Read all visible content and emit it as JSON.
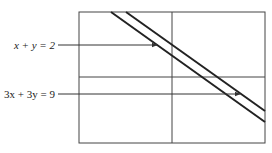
{
  "diagram": {
    "type": "graph-of-parallel-lines",
    "axes": {
      "x_axis_y": 77,
      "y_axis_x": 172
    },
    "frame": {
      "x": 79,
      "y": 12,
      "width": 186,
      "height": 131
    },
    "lines": [
      {
        "equation": "x + y = 2",
        "label": "x + y = 2",
        "x1": 111,
        "y1": 12,
        "x2": 265,
        "y2": 122
      },
      {
        "equation": "3x + 3y = 9",
        "label": "3x + 3y = 9",
        "x1": 126,
        "y1": 12,
        "x2": 265,
        "y2": 111
      }
    ],
    "annotations": [
      {
        "text": "x + y = 2",
        "label_x": 55,
        "label_y": 49,
        "arrow_from_x": 58,
        "arrow_to_x": 157,
        "arrow_y": 45
      },
      {
        "text": "3x + 3y = 9",
        "label_x": 55,
        "label_y": 98,
        "arrow_from_x": 58,
        "arrow_to_x": 240,
        "arrow_y": 94
      }
    ],
    "colors": {
      "line": "#222222",
      "axis": "#444444",
      "frame": "#444444"
    }
  }
}
